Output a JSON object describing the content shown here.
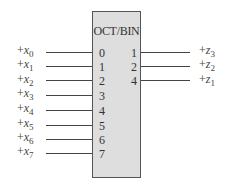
{
  "diagram": {
    "block": {
      "title": "OCT/BIN",
      "input_pins": [
        "0",
        "1",
        "2",
        "3",
        "4",
        "5",
        "6",
        "7"
      ],
      "output_pins": [
        "1",
        "2",
        "4"
      ]
    },
    "inputs": [
      {
        "prefix": "+",
        "var": "x",
        "sub": "0"
      },
      {
        "prefix": "+",
        "var": "x",
        "sub": "1"
      },
      {
        "prefix": "+",
        "var": "x",
        "sub": "2"
      },
      {
        "prefix": "+",
        "var": "x",
        "sub": "3"
      },
      {
        "prefix": "+",
        "var": "x",
        "sub": "4"
      },
      {
        "prefix": "+",
        "var": "x",
        "sub": "5"
      },
      {
        "prefix": "+",
        "var": "x",
        "sub": "6"
      },
      {
        "prefix": "+",
        "var": "x",
        "sub": "7"
      }
    ],
    "outputs": [
      {
        "prefix": "+",
        "var": "z",
        "sub": "3"
      },
      {
        "prefix": "+",
        "var": "z",
        "sub": "2"
      },
      {
        "prefix": "+",
        "var": "z",
        "sub": "1"
      }
    ],
    "colors": {
      "block_fill": "#dedede",
      "line": "#444444"
    }
  }
}
